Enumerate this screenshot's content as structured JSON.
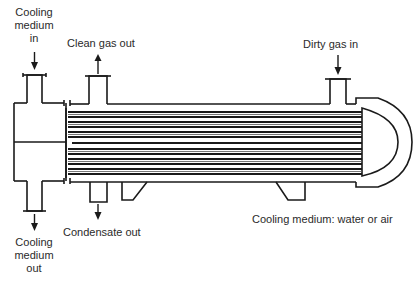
{
  "diagram": {
    "type": "shell-and-tube condenser (gas cooler)",
    "labels": {
      "cooling_medium_in": [
        "Cooling",
        "medium",
        "in"
      ],
      "clean_gas_out": "Clean gas out",
      "dirty_gas_in": "Dirty gas in",
      "cooling_medium_out": [
        "Cooling",
        "medium",
        "out"
      ],
      "condensate_out": "Condensate out",
      "cooling_medium_note": "Cooling medium: water or air"
    },
    "colors": {
      "line": "#1a1a1a",
      "text": "#2a2a2a",
      "background": "#ffffff"
    }
  }
}
